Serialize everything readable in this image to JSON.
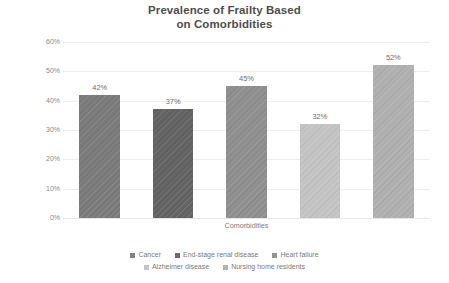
{
  "chart_data": {
    "type": "bar",
    "title": "Prevalence of Frailty Based on Comorbidities",
    "title_lines": [
      "Prevalence of Frailty Based",
      "on Comorbidities"
    ],
    "xlabel": "Comorbidities",
    "ylabel": "Prevalence of Frailty%",
    "ylim": [
      0,
      60
    ],
    "ytick_labels": [
      "60%",
      "50%",
      "40%",
      "30%",
      "20%",
      "10%",
      "0%"
    ],
    "ytick_values": [
      60,
      50,
      40,
      30,
      20,
      10,
      0
    ],
    "grid": true,
    "legend_position": "bottom",
    "categories": [
      "Cancer",
      "End-stage renal disease",
      "Heart failure",
      "Alzheimer disease",
      "Nursing home residents"
    ],
    "values": [
      42,
      37,
      45,
      32,
      52
    ],
    "data_labels": [
      "42%",
      "37%",
      "45%",
      "32%",
      "52%"
    ],
    "colors": [
      "#7b7b7b",
      "#636363",
      "#8f8f8f",
      "#c4c4c4",
      "#b0b0b0"
    ],
    "bars": [
      {
        "category": "Cancer",
        "value": 42,
        "label": "42%",
        "color": "#7b7b7b"
      },
      {
        "category": "End-stage renal disease",
        "value": 37,
        "label": "37%",
        "color": "#636363"
      },
      {
        "category": "Heart failure",
        "value": 45,
        "label": "45%",
        "color": "#8f8f8f"
      },
      {
        "category": "Alzheimer disease",
        "value": 32,
        "label": "32%",
        "color": "#c4c4c4"
      },
      {
        "category": "Nursing home residents",
        "value": 52,
        "label": "52%",
        "color": "#b0b0b0"
      }
    ]
  },
  "legend": {
    "row1": [
      {
        "label": "Cancer",
        "color": "#7b7b7b"
      },
      {
        "label": "End-stage renal disease",
        "color": "#636363"
      },
      {
        "label": "Heart failure",
        "color": "#8f8f8f"
      }
    ],
    "row2": [
      {
        "label": "Alzheimer disease",
        "color": "#c4c4c4"
      },
      {
        "label": "Nursing home residents",
        "color": "#b0b0b0"
      }
    ]
  }
}
